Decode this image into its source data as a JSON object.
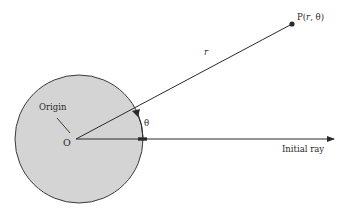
{
  "diagram": {
    "labels": {
      "point": "P(r, θ)",
      "point_prefix": "P(",
      "point_r": "r",
      "point_sep": ", θ)",
      "radius": "r",
      "angle": "θ",
      "origin_name": "Origin",
      "origin_letter": "O",
      "initial_ray": "Initial ray"
    },
    "colors": {
      "disc_fill": "#d4d4d4",
      "line": "#2a2a2a",
      "background": "#ffffff"
    }
  }
}
